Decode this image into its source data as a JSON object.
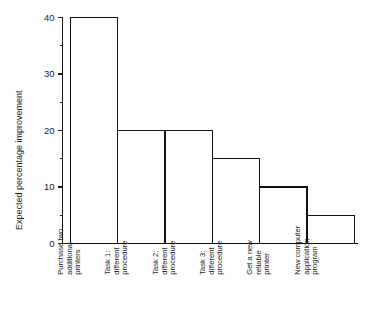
{
  "chart_data": {
    "type": "bar",
    "title": "",
    "subtitle": "",
    "xlabel": "",
    "ylabel": "Expected percentage improvement",
    "ylim": [
      0,
      40
    ],
    "grid": false,
    "legend": false,
    "legend_position": "none",
    "y_major_ticks": [
      0,
      10,
      20,
      30,
      40
    ],
    "y_minor_ticks": [
      5,
      15,
      25,
      35
    ],
    "y_tick_labels": [
      "0",
      "10",
      "20",
      "30",
      "40"
    ],
    "bar_style": "outline",
    "bars_adjacent": true,
    "categories": [
      "Purchase two additional printers",
      "Task 1: different procedure",
      "Task 2: different procedure",
      "Task 3: different procedure",
      "Get a new reliable printer",
      "New computer application program"
    ],
    "category_lines": [
      [
        "Purchase two",
        "additional",
        "printers"
      ],
      [
        "Task 1:",
        "different",
        "procedure"
      ],
      [
        "Task 2:",
        "different",
        "procedure"
      ],
      [
        "Task 3:",
        "different",
        "procedure"
      ],
      [
        "Get a new",
        "reliable",
        "printer"
      ],
      [
        "New computer",
        "application",
        "program"
      ]
    ],
    "values": [
      40,
      20,
      20,
      15,
      10,
      5
    ],
    "colors": {
      "bar_fill": "#ffffff",
      "bar_stroke": "#111111",
      "axis": "#1a1a1a",
      "background": "#ffffff",
      "text": "#1a1a1a"
    }
  }
}
